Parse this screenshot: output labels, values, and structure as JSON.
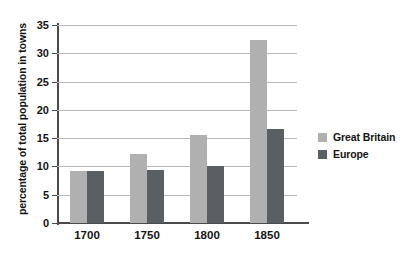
{
  "chart_data": {
    "type": "bar",
    "title": "",
    "xlabel": "",
    "ylabel": "percentage of total population in towns",
    "categories": [
      "1700",
      "1750",
      "1800",
      "1850"
    ],
    "series": [
      {
        "name": "Great Britain",
        "color": "#b0b0b0",
        "values": [
          9.2,
          12.2,
          15.5,
          32.3
        ]
      },
      {
        "name": "Europe",
        "color": "#5a5f63",
        "values": [
          9.2,
          9.3,
          10.0,
          16.6
        ]
      }
    ],
    "ylim": [
      0,
      35
    ],
    "ytick_labels": [
      "0",
      "5",
      "10",
      "15",
      "20",
      "25",
      "30",
      "35"
    ],
    "ytick_values": [
      0,
      5,
      10,
      15,
      20,
      25,
      30,
      35
    ],
    "grid": true,
    "grid_axis": "y",
    "legend_position": "right",
    "background_color": "#ffffff",
    "axis_color": "#4a4a4a",
    "gridline_color": "#b9b9b9"
  }
}
